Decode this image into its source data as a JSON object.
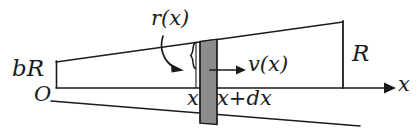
{
  "figure": {
    "kind": "tapered-tube-flow-diagram",
    "background_color": "#ffffff",
    "ink_color": "#1b1b1b",
    "slice_fill_color": "#8c8c8c",
    "labels": {
      "inlet_radius": "bR",
      "origin": "O",
      "local_radius": "r(x)",
      "velocity": "v(x)",
      "outlet_radius": "R",
      "axis": "x",
      "slice_left": "x",
      "slice_right": "x+dx"
    },
    "icons": {
      "axis_arrow": "arrow-right-icon",
      "velocity_arrow": "arrow-right-icon",
      "callout_arrow": "curved-arrow-icon",
      "brace": "curly-brace-icon"
    }
  }
}
